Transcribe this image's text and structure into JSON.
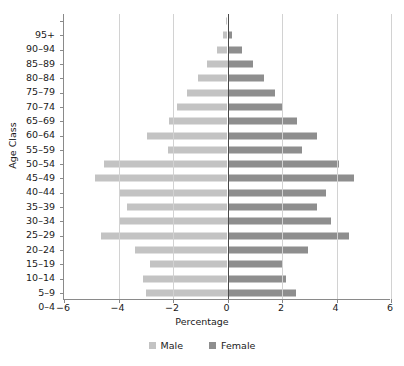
{
  "chart_data": {
    "type": "bar",
    "subtype": "population-pyramid",
    "title": "",
    "xlabel": "Percentage",
    "ylabel": "Age Class",
    "xlim": [
      -6,
      6
    ],
    "xticks": [
      -6,
      -4,
      -2,
      0,
      2,
      4,
      6
    ],
    "xtick_labels": [
      "−6",
      "−4",
      "−2",
      "0",
      "2",
      "4",
      "6"
    ],
    "grid": true,
    "grid_axis": "x",
    "legend_position": "bottom",
    "categories": [
      "95+",
      "90–94",
      "85–89",
      "80–84",
      "75–79",
      "70–74",
      "65–69",
      "60–64",
      "55–59",
      "50–54",
      "45–49",
      "40–44",
      "35–39",
      "30–34",
      "25–29",
      "20–24",
      "15–19",
      "10–14",
      "5–9",
      "0–4"
    ],
    "series": [
      {
        "name": "Male",
        "color": "#c3c3c3",
        "sign": "negative",
        "values": [
          -0.05,
          -0.15,
          -0.4,
          -0.75,
          -1.1,
          -1.5,
          -1.85,
          -2.15,
          -2.95,
          -2.2,
          -4.55,
          -4.85,
          -3.95,
          -3.7,
          -4.0,
          -4.65,
          -3.4,
          -2.85,
          -3.1,
          -3.0
        ]
      },
      {
        "name": "Female",
        "color": "#8e8e8e",
        "sign": "positive",
        "values": [
          0.05,
          0.15,
          0.55,
          0.95,
          1.35,
          1.75,
          2.0,
          2.55,
          3.3,
          2.75,
          4.1,
          4.65,
          3.6,
          3.3,
          3.8,
          4.45,
          2.95,
          2.05,
          2.15,
          2.5
        ]
      }
    ]
  },
  "legend": {
    "items": [
      {
        "label": "Male",
        "color": "#c3c3c3"
      },
      {
        "label": "Female",
        "color": "#8e8e8e"
      }
    ]
  }
}
